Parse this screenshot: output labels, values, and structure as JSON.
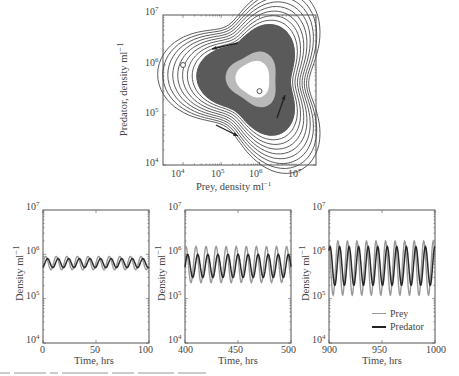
{
  "chart_data": [
    {
      "type": "line",
      "subtype": "phase-plot",
      "title": "",
      "xlabel": "Prey, density ml⁻¹",
      "ylabel": "Predator, density ml⁻¹",
      "xscale": "log",
      "yscale": "log",
      "xlim": [
        3000,
        30000000
      ],
      "ylim": [
        10000,
        10000000
      ],
      "xticks": [
        "10^4",
        "10^5",
        "10^6",
        "10^7"
      ],
      "yticks": [
        "10^4",
        "10^5",
        "10^6",
        "10^7"
      ],
      "grid": false,
      "annotations": {
        "start_marker": {
          "x": 10000,
          "y": 1000000,
          "shape": "open-circle"
        },
        "end_marker": {
          "x": 1000000,
          "y": 300000,
          "shape": "open-circle"
        },
        "arrows": [
          "top: pointing left",
          "bottom-left: pointing right",
          "right: pointing up"
        ],
        "description": "Trajectory spirals outward from the equilibrium region into a counter-clockwise limit cycle; dense dark band at outer cycle, light grey ring inside, white center"
      }
    },
    {
      "type": "line",
      "panel": "a",
      "xlabel": "Time, hrs",
      "ylabel": "Density ml⁻¹",
      "xlim": [
        0,
        100
      ],
      "ylim": [
        10000,
        10000000
      ],
      "yscale": "log",
      "xticks": [
        "0",
        "50",
        "100"
      ],
      "yticks": [
        "10^4",
        "10^5",
        "10^6",
        "10^7"
      ],
      "period_hrs": 10,
      "series": [
        {
          "name": "Prey",
          "color": "#9a9a9a",
          "min": 450000,
          "max": 900000
        },
        {
          "name": "Predator",
          "color": "#2a2a2a",
          "min": 500000,
          "max": 800000
        }
      ]
    },
    {
      "type": "line",
      "panel": "b",
      "xlabel": "Time, hrs",
      "ylabel": "Density ml⁻¹",
      "xlim": [
        400,
        500
      ],
      "ylim": [
        10000,
        10000000
      ],
      "yscale": "log",
      "xticks": [
        "400",
        "450",
        "500"
      ],
      "yticks": [
        "10^4",
        "10^5",
        "10^6",
        "10^7"
      ],
      "period_hrs": 9.5,
      "series": [
        {
          "name": "Prey",
          "color": "#9a9a9a",
          "min": 230000,
          "max": 1500000
        },
        {
          "name": "Predator",
          "color": "#2a2a2a",
          "min": 300000,
          "max": 1000000
        }
      ]
    },
    {
      "type": "line",
      "panel": "c",
      "xlabel": "Time, hrs",
      "ylabel": "Density ml⁻¹",
      "xlim": [
        900,
        1000
      ],
      "ylim": [
        10000,
        10000000
      ],
      "yscale": "log",
      "xticks": [
        "900",
        "950",
        "1000"
      ],
      "yticks": [
        "10^4",
        "10^5",
        "10^6",
        "10^7"
      ],
      "period_hrs": 9,
      "legend": {
        "position": "lower right",
        "entries": [
          "Prey",
          "Predator"
        ]
      },
      "series": [
        {
          "name": "Prey",
          "color": "#9a9a9a",
          "min": 120000,
          "max": 2000000
        },
        {
          "name": "Predator",
          "color": "#2a2a2a",
          "min": 200000,
          "max": 1500000
        }
      ]
    }
  ],
  "top": {
    "xlabel": "Prey, density ml",
    "ylabel": "Predator, density ml",
    "unit_exp": "−1",
    "xticks": [
      {
        "base": "10",
        "exp": "4"
      },
      {
        "base": "10",
        "exp": "5"
      },
      {
        "base": "10",
        "exp": "6"
      },
      {
        "base": "10",
        "exp": "7"
      }
    ],
    "yticks": [
      {
        "base": "10",
        "exp": "7"
      },
      {
        "base": "10",
        "exp": "6"
      },
      {
        "base": "10",
        "exp": "5"
      },
      {
        "base": "10",
        "exp": "4"
      }
    ]
  },
  "bottom": {
    "ylabel": "Density ml",
    "unit_exp": "−1",
    "xlabel": "Time, hrs",
    "yticks": [
      {
        "base": "10",
        "exp": "7"
      },
      {
        "base": "10",
        "exp": "6"
      },
      {
        "base": "10",
        "exp": "5"
      },
      {
        "base": "10",
        "exp": "4"
      }
    ],
    "panels": [
      {
        "xticks": [
          "0",
          "50",
          "100"
        ]
      },
      {
        "xticks": [
          "400",
          "450",
          "500"
        ]
      },
      {
        "xticks": [
          "900",
          "950",
          "1000"
        ]
      }
    ]
  },
  "legend": {
    "prey": "Prey",
    "predator": "Predator",
    "prey_color": "#9a9a9a",
    "predator_color": "#222222"
  },
  "colors": {
    "axis": "#555555",
    "cycle_dark": "#5a5a5a",
    "cycle_light": "#b9b9b9",
    "curve": "#4a4a4a"
  }
}
